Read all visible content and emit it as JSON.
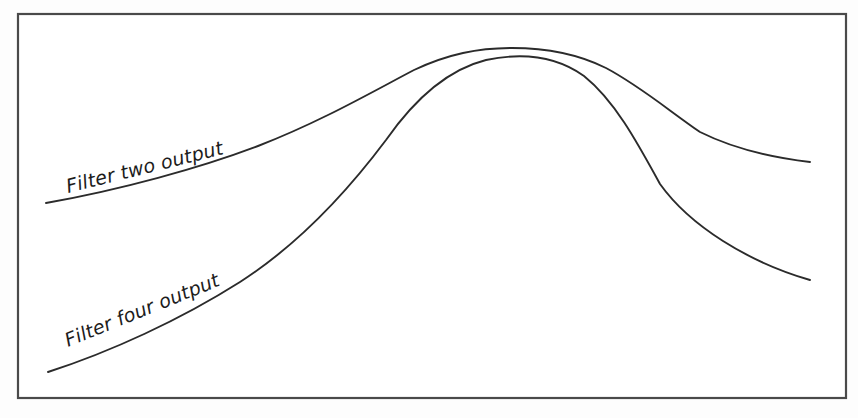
{
  "figure": {
    "name": "filter-output-response-curves",
    "background_color": "#fdfdfd",
    "plot_background_color": "#ffffff",
    "frame": {
      "stroke_color": "#4a4a4a",
      "stroke_width": 2.2,
      "x": 18,
      "y": 14,
      "width": 828,
      "height": 384
    },
    "curve_color": "#2b2b2b",
    "label_color": "#1c1c1c"
  },
  "labels": {
    "filter_two": "Filter two output",
    "filter_four": "Filter four output"
  },
  "chart_data": {
    "type": "line",
    "title": "",
    "subtitle": "",
    "xlabel": "",
    "ylabel": "",
    "xlim": [
      18,
      846
    ],
    "ylim": [
      14,
      398
    ],
    "grid": false,
    "legend": "inline-curve-labels",
    "axis_ticks": false,
    "annotations": [
      {
        "text": "Filter two output",
        "x": 68,
        "y": 193,
        "rotation_deg": -14,
        "style": "italic"
      },
      {
        "text": "Filter four output",
        "x": 68,
        "y": 347,
        "rotation_deg": -22,
        "style": "italic"
      }
    ],
    "series": [
      {
        "name": "Filter two output",
        "description": "Broad low-order filter response: gentle rise, flat rounded peak, slow gradual roll-off",
        "path": "M 46 203 C 120 190 200 168 258 146 C 320 122 372 92 414 70 C 448 54 478 48 512 48 C 548 48 578 54 606 68 C 640 86 668 110 700 132 C 736 150 776 158 810 162",
        "points": [
          [
            46,
            203
          ],
          [
            120,
            190
          ],
          [
            190,
            170
          ],
          [
            258,
            146
          ],
          [
            320,
            120
          ],
          [
            370,
            94
          ],
          [
            414,
            70
          ],
          [
            460,
            55
          ],
          [
            512,
            48
          ],
          [
            560,
            50
          ],
          [
            606,
            62
          ],
          [
            650,
            86
          ],
          [
            700,
            116
          ],
          [
            750,
            142
          ],
          [
            790,
            156
          ],
          [
            810,
            162
          ]
        ],
        "endpoints": {
          "left": [
            46,
            203
          ],
          "right": [
            810,
            162
          ]
        }
      },
      {
        "name": "Filter four output",
        "description": "Sharper high-order filter response: steep rise, narrow rounded peak, fast steep roll-off",
        "path": "M 48 372 C 110 352 180 320 240 282 C 296 246 344 196 386 140 C 414 100 446 70 486 60 C 524 52 556 56 584 76 C 614 100 636 140 660 184 C 690 226 748 262 810 280",
        "points": [
          [
            48,
            372
          ],
          [
            110,
            350
          ],
          [
            178,
            318
          ],
          [
            240,
            282
          ],
          [
            296,
            244
          ],
          [
            344,
            194
          ],
          [
            386,
            140
          ],
          [
            420,
            98
          ],
          [
            460,
            68
          ],
          [
            500,
            58
          ],
          [
            540,
            58
          ],
          [
            584,
            76
          ],
          [
            620,
            112
          ],
          [
            660,
            184
          ],
          [
            720,
            234
          ],
          [
            770,
            264
          ],
          [
            810,
            280
          ]
        ],
        "endpoints": {
          "left": [
            48,
            372
          ],
          "right": [
            810,
            280
          ]
        }
      }
    ]
  }
}
